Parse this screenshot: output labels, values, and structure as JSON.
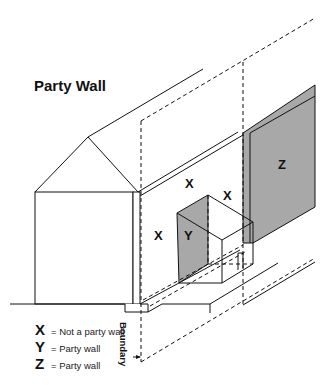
{
  "diagram": {
    "title": "Party Wall",
    "labels": {
      "x_upper": "X",
      "x_right": "X",
      "x_left": "X",
      "y_face": "Y",
      "z_wall": "Z"
    },
    "boundary_label": "Boundary",
    "legend": [
      {
        "key": "X",
        "text": "= Not a party wall"
      },
      {
        "key": "Y",
        "text": "= Party wall"
      },
      {
        "key": "Z",
        "text": "= Party wall"
      }
    ],
    "colors": {
      "line": "#111111",
      "shade": "#a8a8a8",
      "background": "#ffffff"
    }
  }
}
